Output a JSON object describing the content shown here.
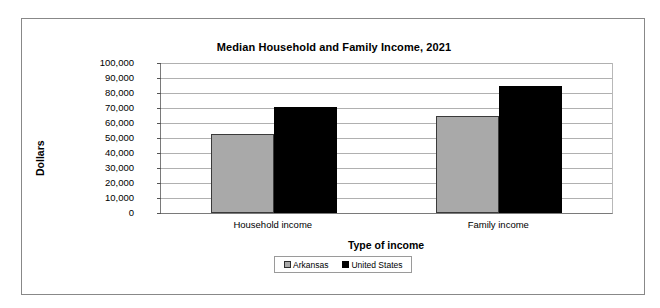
{
  "chart_data": {
    "type": "bar",
    "title": "Median Household and Family Income, 2021",
    "xlabel": "Type of income",
    "ylabel": "Dollars",
    "categories": [
      "Household income",
      "Family income"
    ],
    "series": [
      {
        "name": "Arkansas",
        "values": [
          52500,
          65000
        ],
        "color": "#a9a9a9"
      },
      {
        "name": "United States",
        "values": [
          71000,
          85000
        ],
        "color": "#000000"
      }
    ],
    "ylim": [
      0,
      100000
    ],
    "ytick_labels": [
      "100,000",
      "90,000",
      "80,000",
      "70,000",
      "60,000",
      "50,000",
      "40,000",
      "30,000",
      "20,000",
      "10,000",
      "0"
    ],
    "ytick_values": [
      100000,
      90000,
      80000,
      70000,
      60000,
      50000,
      40000,
      30000,
      20000,
      10000,
      0
    ],
    "grid": true,
    "legend_position": "bottom"
  }
}
